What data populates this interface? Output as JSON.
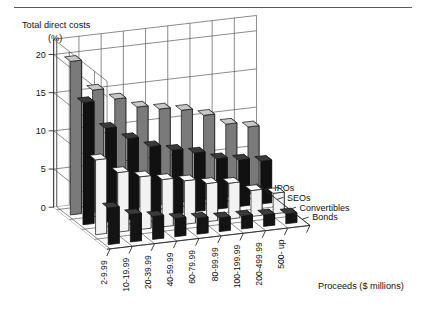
{
  "figure": {
    "top_rule": true,
    "background_color": "#ffffff"
  },
  "chart_data": {
    "type": "bar",
    "subtype": "3d-grouped-bar",
    "title": "",
    "ylabel": "Total direct costs",
    "ylabel_unit": "(%)",
    "xlabel": "Proceeds ($ millions)",
    "zlabel": "",
    "ylim": [
      0,
      22
    ],
    "yticks": [
      0,
      5,
      10,
      15,
      20
    ],
    "ytick_labels": [
      "0",
      "5",
      "10",
      "15",
      "20"
    ],
    "grid": true,
    "legend_position": "right-depth-axis",
    "categories": [
      "2-9.99",
      "10-19.99",
      "20-39.99",
      "40-59.99",
      "60-79.99",
      "80-99.99",
      "100-199.99",
      "200-499.99",
      "500- up"
    ],
    "series": [
      {
        "name": "IPOs",
        "color": "#7a7a7a",
        "top_color": "#c8c8c8",
        "side_color": "#e8e8e8",
        "values": [
          20.1,
          16.0,
          14.5,
          13.1,
          12.5,
          12.0,
          11.0,
          9.5,
          8.8
        ]
      },
      {
        "name": "SEOs",
        "color": "#111111",
        "top_color": "#3a3a3a",
        "side_color": "#5a5a5a",
        "values": [
          16.0,
          12.3,
          10.6,
          9.2,
          8.4,
          7.7,
          6.6,
          6.1,
          5.6
        ]
      },
      {
        "name": "Convertibles",
        "color": "#f2f2f2",
        "top_color": "#ffffff",
        "side_color": "#d4d4d4",
        "values": [
          9.8,
          7.8,
          6.9,
          6.2,
          5.7,
          5.0,
          4.7,
          3.4,
          2.7
        ]
      },
      {
        "name": "Bonds",
        "color": "#141414",
        "top_color": "#3a3a3a",
        "side_color": "#5a5a5a",
        "values": [
          4.8,
          3.6,
          3.0,
          2.4,
          2.1,
          1.8,
          1.7,
          1.5,
          1.3
        ]
      }
    ]
  }
}
